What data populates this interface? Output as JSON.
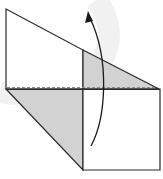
{
  "diagram": {
    "type": "origami-fold-step",
    "colors": {
      "background": "#ffffff",
      "paper_front": "#ffffff",
      "paper_back_shaded": "#d2d2d2",
      "line": "#2a2a2a",
      "fold_line": "#8a8a8a",
      "watermark": "#f0f0f0"
    },
    "shapes": {
      "upper_panel": "6,9 83,50 83,89 6,89",
      "upper_right_shaded_triangle": "83,50 159,89 83,89",
      "lower_left_shaded_flap": "6,89 83,89 83,170",
      "lower_right_square": "83,89 160,89 160,170 83,170"
    },
    "fold_line": {
      "type": "valley-dashed",
      "x1": 6,
      "y1": 88,
      "x2": 159,
      "y2": 88
    },
    "arrow": {
      "direction": "up",
      "path": "M91,146 C106,118 110,60 88,13"
    }
  }
}
